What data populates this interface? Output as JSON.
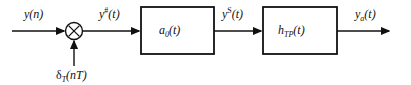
{
  "diagram": {
    "type": "signal-flow-block-diagram",
    "background_color": "#ffffff",
    "stroke_color": "#111111",
    "labels": {
      "input_signal": "y(n)",
      "input_signal_plain": "y(n)",
      "sampled_signal_base": "y",
      "sampled_signal_sup": "#",
      "sampled_signal_tail": "(t)",
      "delta_base": "δ",
      "delta_sub": "T",
      "delta_tail": "(nT)",
      "held_signal_base": "y",
      "held_signal_sup": "S",
      "held_signal_tail": "(t)",
      "output_base": "y",
      "output_sub": "a",
      "output_tail": "(t)"
    },
    "blocks": [
      {
        "name": "interpolation-block",
        "label_base": "a",
        "label_sub": "0",
        "label_tail": "(t)",
        "x": 141,
        "y": 7,
        "width": 73,
        "height": 47
      },
      {
        "name": "lowpass-filter-block",
        "label_base": "h",
        "label_sub": "TP",
        "label_tail": "(t)",
        "x": 263,
        "y": 7,
        "width": 74,
        "height": 47
      }
    ],
    "multiplier": {
      "name": "multiplier-node",
      "glyph": "⊗",
      "cx": 74,
      "cy": 31,
      "r": 8.5
    },
    "signal_paths": [
      {
        "name": "input-arrow",
        "from": [
          12,
          31
        ],
        "to": [
          65,
          31
        ],
        "arrowhead": true
      },
      {
        "name": "sampling-arrow",
        "from": [
          74,
          66
        ],
        "to": [
          74,
          40
        ],
        "arrowhead": true
      },
      {
        "name": "mult-to-block1",
        "from": [
          83,
          31
        ],
        "to": [
          140,
          31
        ],
        "arrowhead": true
      },
      {
        "name": "block1-to-block2",
        "from": [
          214,
          31
        ],
        "to": [
          262,
          31
        ],
        "arrowhead": true
      },
      {
        "name": "block2-to-output",
        "from": [
          337,
          31
        ],
        "to": [
          390,
          31
        ],
        "arrowhead": true
      }
    ]
  }
}
